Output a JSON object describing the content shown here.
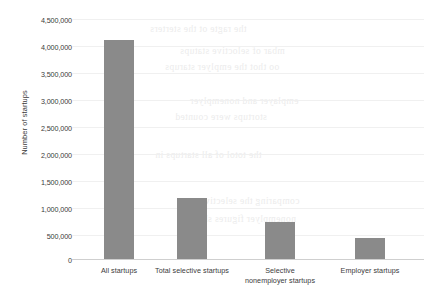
{
  "chart_data": {
    "type": "bar",
    "title": "",
    "xlabel": "",
    "ylabel": "Number of startups",
    "categories": [
      "All startups",
      "Total selective startups",
      "Selective nonemployer startups",
      "Employer startups"
    ],
    "values": [
      4100000,
      1150000,
      690000,
      400000
    ],
    "ylim": [
      0,
      4500000
    ],
    "ytick_labels": [
      "4,500,000",
      "4,000,000",
      "3,500,000",
      "3,000,000",
      "2,500,000",
      "2,000,000",
      "1,500,000",
      "1,000,000",
      "500,000",
      "0"
    ],
    "ytick_values": [
      4500000,
      4000000,
      3500000,
      3000000,
      2500000,
      2000000,
      1500000,
      1000000,
      500000,
      0
    ],
    "grid": true,
    "legend": false,
    "bar_color": "#8a8a8a",
    "background_color": "#ffffff"
  },
  "category_labels": {
    "c0_line1": "All startups",
    "c0_line2": "",
    "c1_line1": "Total selective startups",
    "c1_line2": "",
    "c2_line1": "Selective",
    "c2_line2": "nonemployer startups",
    "c3_line1": "Employer startups",
    "c3_line2": ""
  },
  "scan_artifacts": {
    "note": "faint reverse-side bleed-through text visible in scan background"
  }
}
